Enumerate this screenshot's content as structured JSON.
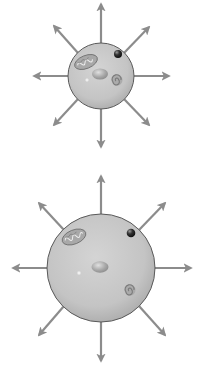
{
  "figure": {
    "colors": {
      "background": "#ffffff",
      "arrow": "#8c8c8c",
      "cell_fill": "#c6c6c6",
      "cell_outline": "#5a5a5a",
      "organelle_dark": "#2c2c2c",
      "organelle_mid": "#9a9a9a"
    },
    "cells": [
      {
        "id": "small-cell",
        "center": [
          101,
          76
        ],
        "radius": 33,
        "arrow_tips": {
          "up": [
            101,
            3
          ],
          "down": [
            101,
            148
          ],
          "left": [
            33,
            76
          ],
          "right": [
            170,
            76
          ],
          "up_left": [
            53,
            25
          ],
          "up_right": [
            150,
            26
          ],
          "down_left": [
            53,
            126
          ],
          "down_right": [
            150,
            126
          ]
        },
        "organelles": [
          "mitochondrion",
          "dark-vesicle",
          "nucleus",
          "bright-granule",
          "spiral-golgi"
        ]
      },
      {
        "id": "large-cell",
        "center": [
          101,
          268
        ],
        "radius": 54,
        "arrow_tips": {
          "up": [
            101,
            175
          ],
          "down": [
            101,
            362
          ],
          "left": [
            12,
            268
          ],
          "right": [
            192,
            268
          ],
          "up_left": [
            38,
            202
          ],
          "up_right": [
            166,
            202
          ],
          "down_left": [
            38,
            336
          ],
          "down_right": [
            166,
            336
          ]
        },
        "organelles": [
          "mitochondrion",
          "dark-vesicle",
          "nucleus",
          "bright-granule",
          "spiral-golgi"
        ]
      }
    ]
  }
}
